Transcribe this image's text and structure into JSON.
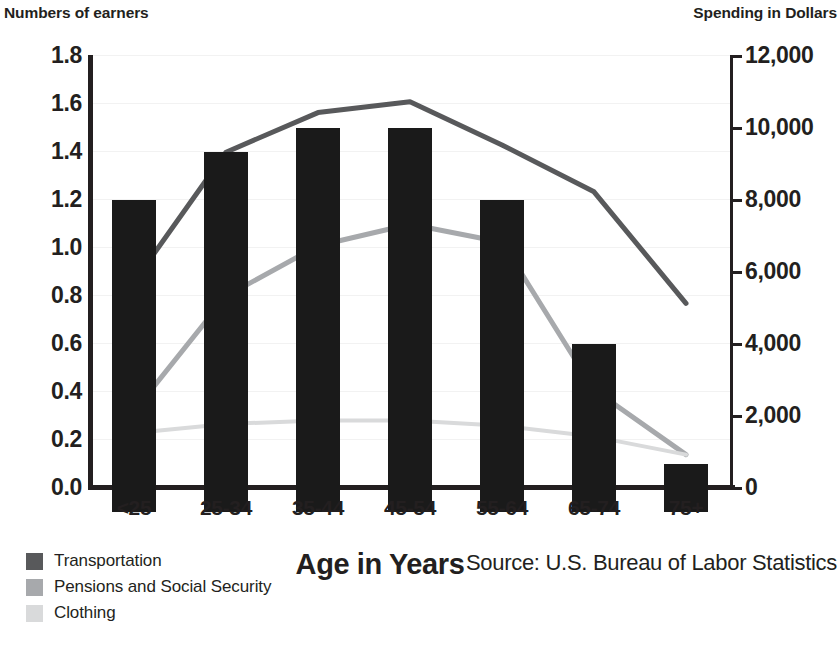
{
  "header": {
    "left_axis_title": "Numbers of earners",
    "right_axis_title": "Spending in Dollars"
  },
  "axes": {
    "left_ticks": [
      "1.8",
      "1.6",
      "1.4",
      "1.2",
      "1.0",
      "0.8",
      "0.6",
      "0.4",
      "0.2",
      "0.0"
    ],
    "right_ticks": [
      "12,000",
      "10,000",
      "8,000",
      "6,000",
      "4,000",
      "2,000",
      "0"
    ],
    "x_title": "Age in Years",
    "x_ticks": [
      "<25",
      "25-34",
      "35-44",
      "45-54",
      "55-64",
      "65-74",
      "75+"
    ]
  },
  "legend": {
    "items": [
      {
        "label": "Transportation",
        "color": "#58595b"
      },
      {
        "label": "Pensions and Social Security",
        "color": "#a7a9ac"
      },
      {
        "label": "Clothing",
        "color": "#d9dadb"
      }
    ]
  },
  "source": {
    "text": "Source: U.S. Bureau of Labor Statistics"
  },
  "colors": {
    "bar": "#1a1a1a",
    "transportation": "#58595b",
    "pensions": "#a7a9ac",
    "clothing": "#d9dadb",
    "axis": "#231f20",
    "grid": "#f2f2f2",
    "background": "#ffffff"
  },
  "chart_data": {
    "type": "bar",
    "title": "",
    "categories": [
      "<25",
      "25-34",
      "35-44",
      "45-54",
      "55-64",
      "65-74",
      "75+"
    ],
    "xlabel": "Age in Years",
    "ylabel": "Numbers of earners",
    "y2label": "Spending in Dollars",
    "ylim": [
      0.0,
      1.8
    ],
    "y2lim": [
      0,
      12000
    ],
    "yticks": [
      0.0,
      0.2,
      0.4,
      0.6,
      0.8,
      1.0,
      1.2,
      1.4,
      1.6,
      1.8
    ],
    "y2ticks": [
      0,
      2000,
      4000,
      6000,
      8000,
      10000,
      12000
    ],
    "grid": true,
    "legend_position": "bottom-left",
    "bars": {
      "name": "Number of earners",
      "axis": "left",
      "values": [
        1.3,
        1.5,
        1.6,
        1.6,
        1.3,
        0.7,
        0.2
      ]
    },
    "series": [
      {
        "name": "Transportation",
        "type": "line",
        "axis": "right",
        "color": "#58595b",
        "values": [
          5700,
          9300,
          10400,
          10700,
          9500,
          8200,
          5100
        ]
      },
      {
        "name": "Pensions and Social Security",
        "type": "line",
        "axis": "right",
        "color": "#a7a9ac",
        "values": [
          2100,
          5300,
          6700,
          7300,
          6800,
          2700,
          900
        ]
      },
      {
        "name": "Clothing",
        "type": "line",
        "axis": "right",
        "color": "#d9dadb",
        "values": [
          1500,
          1750,
          1850,
          1850,
          1700,
          1400,
          900
        ]
      }
    ]
  }
}
